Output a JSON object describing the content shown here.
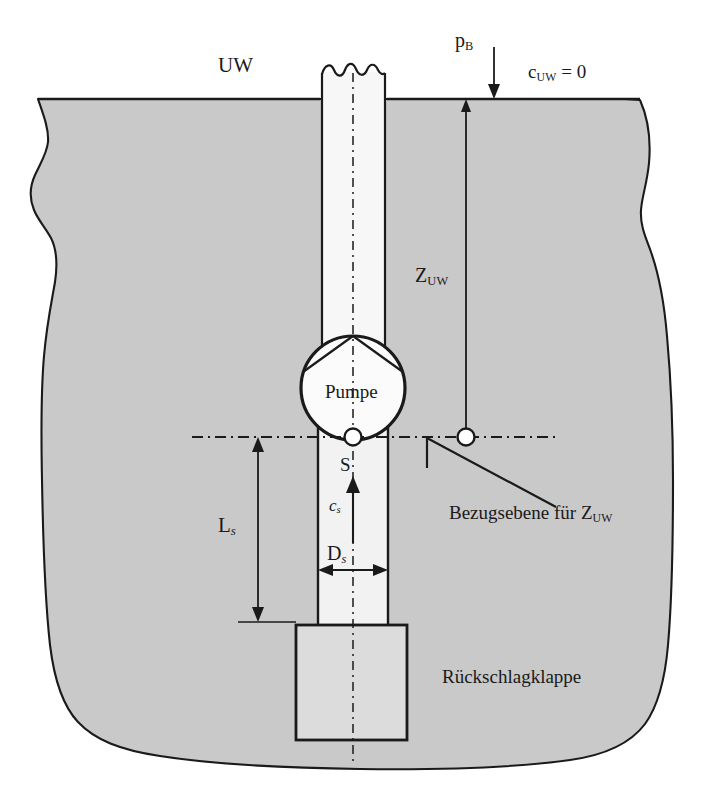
{
  "figure": {
    "kind": "engineering-schematic",
    "colors": {
      "ground_fill": "#c9c9c9",
      "pipe_fill": "#f2f2f2",
      "valve_fill": "#dcdcdc",
      "pump_fill": "#fafafa",
      "line": "#1a1a1a",
      "background": "#ffffff"
    }
  },
  "labels": {
    "uw": "UW",
    "pb_base": "p",
    "pb_sub": "B",
    "cuw": "c",
    "cuw_sub": "UW",
    "cuw_eq": " = 0",
    "zuw_base": "Z",
    "zuw_sub": "UW",
    "pump": "Pumpe",
    "suction_point": "S",
    "cs_base": "c",
    "cs_sub": "s",
    "ds_base": "D",
    "ds_sub": "s",
    "ls_base": "L",
    "ls_sub": "s",
    "datum_prefix": "Bezugsebene für ",
    "datum_symbol": "Z",
    "datum_symbol_sub": "UW",
    "check_valve": "Rückschlagklappe"
  },
  "annotations": {
    "dimensions": [
      {
        "name": "Z_UW",
        "text": "Z_UW",
        "orientation": "vertical",
        "from_y": 100,
        "to_y": 437,
        "x": 466
      },
      {
        "name": "L_s",
        "text": "L_s",
        "orientation": "vertical",
        "from_y": 437,
        "to_y": 622,
        "x": 258
      },
      {
        "name": "D_s",
        "text": "D_s",
        "orientation": "horizontal",
        "from_x": 318,
        "to_x": 388,
        "y": 570
      }
    ],
    "flow_arrows": [
      {
        "name": "c_s",
        "direction": "up",
        "x": 353,
        "from_y": 543,
        "to_y": 478
      },
      {
        "name": "p_B",
        "direction": "down",
        "x": 494,
        "from_y": 47,
        "to_y": 99
      }
    ],
    "markers": [
      {
        "name": "suction-point-S",
        "x": 353,
        "y": 437
      },
      {
        "name": "datum-reference-point",
        "x": 466,
        "y": 437
      }
    ],
    "datum_line": {
      "name": "Bezugsebene",
      "y": 437,
      "from_x": 192,
      "to_x": 560,
      "style": "dash-dot"
    }
  }
}
